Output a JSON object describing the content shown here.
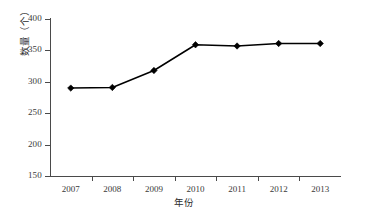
{
  "chart_data": {
    "type": "line",
    "title": "",
    "xlabel": "年份",
    "ylabel": "数量（个）",
    "categories": [
      "2007",
      "2008",
      "2009",
      "2010",
      "2011",
      "2012",
      "2013"
    ],
    "values": [
      290,
      291,
      318,
      359,
      357,
      361,
      361
    ],
    "series": [
      {
        "name": "数量",
        "values": [
          290,
          291,
          318,
          359,
          357,
          361,
          361
        ]
      }
    ],
    "ylim": [
      150,
      400
    ],
    "ytick_labels": [
      "400",
      "350",
      "300",
      "250",
      "200",
      "150"
    ],
    "ytick_values": [
      400,
      350,
      300,
      250,
      200,
      150
    ],
    "ytick_step": 50,
    "xtick_labels": [
      "2007",
      "2008",
      "2009",
      "2010",
      "2011",
      "2012",
      "2013"
    ],
    "grid": false,
    "legend": false,
    "legend_position": "none",
    "marker": "diamond",
    "line_color": "#000000",
    "marker_color": "#000000",
    "axis_color": "#4a4a4a",
    "background_color": "#ffffff"
  }
}
